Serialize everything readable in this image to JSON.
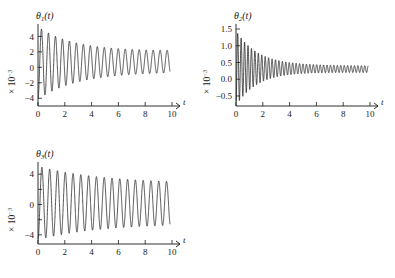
{
  "figure": {
    "background_color": "#ffffff",
    "line_color": "#1a1a1a",
    "panel_count": 3
  },
  "chart_data": [
    {
      "type": "line",
      "title": "θ₁(t)",
      "title_plain": "theta_1(t)",
      "xlabel": "t",
      "ylabel": "× 10⁻³",
      "ylabel_plain": "x 10^-3",
      "xlim": [
        0,
        10
      ],
      "ylim": [
        -5,
        5.6
      ],
      "xticks": [
        0,
        2,
        4,
        6,
        8,
        10
      ],
      "xticklabels": [
        "0",
        "2",
        "4",
        "6",
        "8",
        "10"
      ],
      "yticks": [
        -4,
        -2,
        0,
        2,
        4
      ],
      "yticklabels": [
        "-4",
        "-2",
        "0",
        "2",
        "4"
      ],
      "grid": false,
      "legend": "none",
      "annotation": "damped oscillation decaying to offset",
      "model": {
        "offset_start": 0.55,
        "offset_end": 0.75,
        "amplitude_start": 4.7,
        "amplitude_end": 1.35,
        "decay_rate": 0.17,
        "frequency_cycles_per_unit": 1.92,
        "phase": -1.5708,
        "x_start": 0.02,
        "x_end": 9.85
      }
    },
    {
      "type": "line",
      "title": "θ₂(t)",
      "title_plain": "theta_2(t)",
      "xlabel": "t",
      "ylabel": "× 10⁻³",
      "ylabel_plain": "x 10^-3",
      "xlim": [
        0,
        10
      ],
      "ylim": [
        -0.8,
        1.65
      ],
      "xticks": [
        0,
        2,
        4,
        6,
        8,
        10
      ],
      "xticklabels": [
        "0",
        "2",
        "4",
        "6",
        "8",
        "10"
      ],
      "yticks": [
        -0.5,
        0.0,
        0.5,
        1.0,
        1.5
      ],
      "yticklabels": [
        "-0.5",
        "0.0",
        "0.5",
        "1.0",
        "1.5"
      ],
      "grid": false,
      "legend": "none",
      "annotation": "fast damped oscillation settling near 0.3",
      "model": {
        "offset_start": 0.33,
        "offset_end": 0.3,
        "amplitude_start": 1.12,
        "amplitude_end": 0.1,
        "decay_rate": 0.3,
        "frequency_cycles_per_unit": 3.9,
        "phase": -1.5708,
        "x_start": 0.02,
        "x_end": 9.85
      }
    },
    {
      "type": "line",
      "title": "θ₃(t)",
      "title_plain": "theta_3(t)",
      "xlabel": "t",
      "ylabel": "× 10⁻³",
      "ylabel_plain": "x 10^-3",
      "xlim": [
        0,
        10
      ],
      "ylim": [
        -5.2,
        5.6
      ],
      "xticks": [
        0,
        2,
        4,
        6,
        8,
        10
      ],
      "xticklabels": [
        "0",
        "2",
        "4",
        "6",
        "8",
        "10"
      ],
      "yticks": [
        -4,
        -2,
        0,
        2,
        4
      ],
      "yticklabels": [
        "-4",
        "",
        "0",
        "",
        "4"
      ],
      "grid": false,
      "legend": "none",
      "annotation": "damped oscillation about zero",
      "model": {
        "offset_start": 0.2,
        "offset_end": 0.15,
        "amplitude_start": 4.85,
        "amplitude_end": 2.6,
        "decay_rate": 0.1,
        "frequency_cycles_per_unit": 1.72,
        "phase": -1.5708,
        "x_start": 0.02,
        "x_end": 9.85
      }
    }
  ]
}
